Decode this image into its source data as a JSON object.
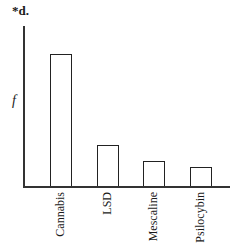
{
  "header": "*d.",
  "chart_data": {
    "type": "bar",
    "title": "",
    "xlabel": "",
    "ylabel": "f",
    "categories": [
      "Cannabis",
      "LSD",
      "Mescaline",
      "Psilocybin"
    ],
    "values": [
      132,
      41,
      25,
      19
    ],
    "value_units": "relative bar height (no numeric scale shown)",
    "ylim": [
      0,
      160
    ],
    "grid": false,
    "legend": null,
    "bar_style": "unfilled outline"
  }
}
